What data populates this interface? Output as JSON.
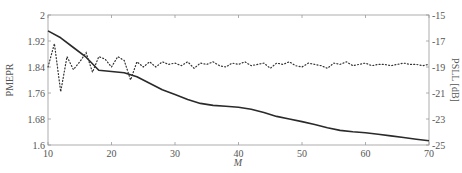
{
  "chart_data": {
    "type": "line",
    "title": "",
    "xlabel": "M",
    "ylabel": "PMEPR",
    "y2label": "PSLL [dB]",
    "xlim": [
      10,
      70
    ],
    "ylim": [
      1.6,
      2.0
    ],
    "y2lim": [
      -25,
      -15
    ],
    "xticks": [
      10,
      20,
      30,
      40,
      50,
      60,
      70
    ],
    "xtick_labels": [
      "10",
      "20",
      "30",
      "40",
      "50",
      "60",
      "70"
    ],
    "yticks": [
      1.6,
      1.68,
      1.76,
      1.84,
      1.92,
      2.0
    ],
    "ytick_labels": [
      "1.6",
      "1.68",
      "1.76",
      "1.84",
      "1.92",
      "2"
    ],
    "y2ticks": [
      -25,
      -23,
      -21,
      -19,
      -17,
      -15
    ],
    "y2tick_labels": [
      "-25",
      "-23",
      "-21",
      "-19",
      "-17",
      "-15"
    ],
    "grid": false,
    "legend": "none",
    "series": [
      {
        "name": "PMEPR",
        "axis": "left",
        "style": "solid",
        "x": [
          10,
          12,
          14,
          16,
          18,
          20,
          22,
          24,
          26,
          28,
          30,
          32,
          34,
          36,
          38,
          40,
          42,
          44,
          46,
          48,
          50,
          52,
          54,
          56,
          58,
          60,
          62,
          64,
          66,
          68,
          70
        ],
        "values": [
          1.951,
          1.93,
          1.9,
          1.87,
          1.83,
          1.826,
          1.822,
          1.81,
          1.79,
          1.77,
          1.755,
          1.74,
          1.728,
          1.722,
          1.719,
          1.716,
          1.71,
          1.7,
          1.688,
          1.68,
          1.672,
          1.663,
          1.653,
          1.645,
          1.641,
          1.638,
          1.633,
          1.628,
          1.623,
          1.618,
          1.613
        ]
      },
      {
        "name": "PSLL",
        "axis": "right",
        "style": "dotted",
        "x": [
          10,
          11,
          12,
          13,
          14,
          15,
          16,
          17,
          18,
          19,
          20,
          21,
          22,
          23,
          24,
          25,
          26,
          27,
          28,
          29,
          30,
          31,
          32,
          33,
          34,
          35,
          36,
          37,
          38,
          39,
          40,
          41,
          42,
          43,
          44,
          45,
          46,
          47,
          48,
          49,
          50,
          51,
          52,
          53,
          54,
          55,
          56,
          57,
          58,
          59,
          60,
          61,
          62,
          63,
          64,
          65,
          66,
          67,
          68,
          69,
          70
        ],
        "values": [
          -19.0,
          -17.2,
          -20.9,
          -18.2,
          -19.2,
          -18.6,
          -17.9,
          -19.4,
          -18.2,
          -18.4,
          -19.0,
          -18.2,
          -18.5,
          -20.0,
          -18.6,
          -19.0,
          -18.6,
          -19.0,
          -18.6,
          -18.8,
          -18.7,
          -18.9,
          -18.6,
          -19.1,
          -18.7,
          -18.8,
          -18.6,
          -18.9,
          -19.0,
          -18.7,
          -18.8,
          -18.6,
          -18.9,
          -18.8,
          -18.7,
          -19.1,
          -18.7,
          -18.8,
          -18.6,
          -18.9,
          -19.0,
          -18.7,
          -18.8,
          -18.9,
          -19.1,
          -18.7,
          -18.8,
          -18.6,
          -18.9,
          -18.8,
          -18.7,
          -18.9,
          -18.8,
          -18.8,
          -18.9,
          -18.8,
          -18.7,
          -18.8,
          -18.8,
          -18.9,
          -18.8
        ]
      }
    ]
  }
}
